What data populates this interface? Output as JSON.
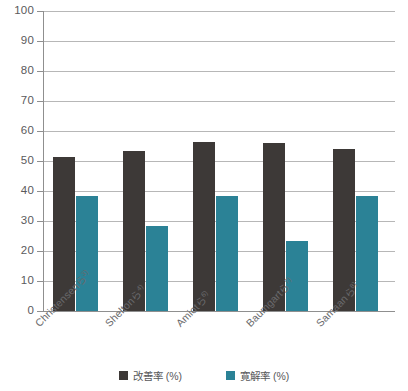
{
  "chart_data": {
    "type": "bar",
    "title": "",
    "subtitle": "",
    "xlabel": "",
    "ylabel": "",
    "ylim": [
      0,
      100
    ],
    "ytick_step": 10,
    "ytick_labels": [
      "100",
      "90",
      "80",
      "70",
      "60",
      "50",
      "40",
      "30",
      "20",
      "10",
      "0"
    ],
    "grid": true,
    "legend_position": "bottom",
    "categories": [
      "Christensenら",
      "Sheltonら",
      "Amiotら",
      "Baumgartら",
      "Samaanら"
    ],
    "category_superscripts": [
      "3)",
      "4)",
      "6)",
      "7)",
      "8)"
    ],
    "series": [
      {
        "name": "改善率 (%)",
        "color": "#3d3937",
        "values": [
          51.5,
          53.5,
          56.5,
          56.0,
          54.0
        ]
      },
      {
        "name": "寛解率 (%)",
        "color": "#2b8296",
        "values": [
          38.5,
          28.5,
          38.5,
          23.5,
          38.5
        ]
      }
    ]
  },
  "colors": {
    "series_improvement": "#3d3937",
    "series_remission": "#2b8296",
    "gridline": "#b7b7b7",
    "axis": "#8f8f8f",
    "text": "#58585a",
    "background": "#ffffff"
  }
}
